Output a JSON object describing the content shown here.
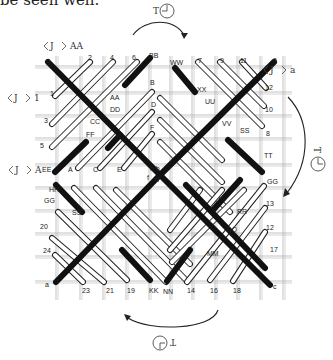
{
  "caption": "be seen well.",
  "rotation_labels": {
    "top": "T",
    "right": "T",
    "bottom": "T"
  },
  "side_labels": [
    {
      "id": "AA",
      "text": "AA",
      "x": 70,
      "y": 46
    },
    {
      "id": "1",
      "text": "1",
      "x": 34,
      "y": 98
    },
    {
      "id": "A",
      "text": "A",
      "x": 35,
      "y": 170
    },
    {
      "id": "a",
      "text": "a",
      "x": 290,
      "y": 70
    }
  ],
  "colors": {
    "grid": "#aaaaaa",
    "black_strand": "#111111",
    "white_strand_fill": "#ffffff",
    "white_strand_stroke": "#222222",
    "text": "#222222"
  },
  "grid": {
    "x": [
      56,
      80,
      103,
      126,
      149,
      170,
      192,
      215,
      237,
      260,
      283
    ],
    "y": [
      66,
      92,
      115,
      138,
      164,
      187,
      210,
      233,
      256,
      281
    ]
  },
  "strand_labels": [
    {
      "t": "g",
      "x": 46,
      "y": 63
    },
    {
      "t": "2",
      "x": 88,
      "y": 60
    },
    {
      "t": "4",
      "x": 110,
      "y": 60
    },
    {
      "t": "6",
      "x": 132,
      "y": 60
    },
    {
      "t": "BB",
      "x": 149,
      "y": 58
    },
    {
      "t": "WW",
      "x": 170,
      "y": 65
    },
    {
      "t": "7",
      "x": 198,
      "y": 63
    },
    {
      "t": "9",
      "x": 220,
      "y": 63
    },
    {
      "t": "11",
      "x": 240,
      "y": 63
    },
    {
      "t": "a",
      "x": 273,
      "y": 62
    },
    {
      "t": "1",
      "x": 50,
      "y": 96
    },
    {
      "t": "AA",
      "x": 110,
      "y": 100
    },
    {
      "t": "XX",
      "x": 197,
      "y": 92
    },
    {
      "t": "12",
      "x": 265,
      "y": 90
    },
    {
      "t": "3",
      "x": 44,
      "y": 123
    },
    {
      "t": "CC",
      "x": 90,
      "y": 124
    },
    {
      "t": "DD",
      "x": 110,
      "y": 112
    },
    {
      "t": "B",
      "x": 150,
      "y": 85
    },
    {
      "t": "UU",
      "x": 205,
      "y": 104
    },
    {
      "t": "VV",
      "x": 222,
      "y": 126
    },
    {
      "t": "10",
      "x": 265,
      "y": 112
    },
    {
      "t": "5",
      "x": 40,
      "y": 148
    },
    {
      "t": "FF",
      "x": 86,
      "y": 137
    },
    {
      "t": "D",
      "x": 151,
      "y": 107
    },
    {
      "t": "SS",
      "x": 240,
      "y": 133
    },
    {
      "t": "8",
      "x": 266,
      "y": 136
    },
    {
      "t": "F",
      "x": 150,
      "y": 130
    },
    {
      "t": "EE",
      "x": 42,
      "y": 172
    },
    {
      "t": "A",
      "x": 68,
      "y": 172
    },
    {
      "t": "C",
      "x": 93,
      "y": 172
    },
    {
      "t": "E",
      "x": 117,
      "y": 172
    },
    {
      "t": "h b",
      "x": 150,
      "y": 171
    },
    {
      "t": "TT",
      "x": 264,
      "y": 158
    },
    {
      "t": "f",
      "x": 147,
      "y": 180
    },
    {
      "t": "d",
      "x": 155,
      "y": 182
    },
    {
      "t": "GG",
      "x": 267,
      "y": 184
    },
    {
      "t": "HH",
      "x": 49,
      "y": 192
    },
    {
      "t": "GG",
      "x": 44,
      "y": 203
    },
    {
      "t": "13",
      "x": 266,
      "y": 206
    },
    {
      "t": "SS",
      "x": 72,
      "y": 215
    },
    {
      "t": "RR",
      "x": 237,
      "y": 214
    },
    {
      "t": "20",
      "x": 40,
      "y": 229
    },
    {
      "t": "QQ",
      "x": 226,
      "y": 232
    },
    {
      "t": "12",
      "x": 266,
      "y": 230
    },
    {
      "t": "24",
      "x": 43,
      "y": 253
    },
    {
      "t": "MM",
      "x": 207,
      "y": 256
    },
    {
      "t": "17",
      "x": 270,
      "y": 252
    },
    {
      "t": "a",
      "x": 45,
      "y": 287
    },
    {
      "t": "23",
      "x": 82,
      "y": 293
    },
    {
      "t": "21",
      "x": 106,
      "y": 293
    },
    {
      "t": "19",
      "x": 127,
      "y": 293
    },
    {
      "t": "KK",
      "x": 149,
      "y": 293
    },
    {
      "t": "NN",
      "x": 163,
      "y": 294
    },
    {
      "t": "14",
      "x": 187,
      "y": 293
    },
    {
      "t": "16",
      "x": 210,
      "y": 293
    },
    {
      "t": "18",
      "x": 233,
      "y": 293
    },
    {
      "t": "c",
      "x": 273,
      "y": 289
    }
  ],
  "black_strands": [
    [
      48,
      62,
      160,
      175
    ],
    [
      150,
      58,
      125,
      85
    ],
    [
      175,
      68,
      195,
      92
    ],
    [
      274,
      62,
      160,
      175
    ],
    [
      120,
      135,
      108,
      148
    ],
    [
      86,
      142,
      55,
      172
    ],
    [
      56,
      185,
      82,
      212
    ],
    [
      228,
      140,
      262,
      172
    ],
    [
      186,
      185,
      265,
      268
    ],
    [
      240,
      180,
      213,
      210
    ],
    [
      160,
      175,
      56,
      282
    ],
    [
      160,
      175,
      270,
      285
    ],
    [
      190,
      250,
      167,
      281
    ],
    [
      122,
      250,
      150,
      280
    ]
  ],
  "white_strands": [
    [
      90,
      62,
      55,
      96
    ],
    [
      113,
      62,
      52,
      124
    ],
    [
      137,
      62,
      52,
      147
    ],
    [
      198,
      62,
      262,
      126
    ],
    [
      220,
      62,
      264,
      106
    ],
    [
      242,
      62,
      266,
      88
    ],
    [
      152,
      92,
      78,
      168
    ],
    [
      152,
      112,
      100,
      168
    ],
    [
      152,
      134,
      124,
      168
    ],
    [
      160,
      98,
      222,
      160
    ],
    [
      160,
      120,
      222,
      182
    ],
    [
      160,
      142,
      230,
      212
    ],
    [
      74,
      188,
      166,
      282
    ],
    [
      96,
      188,
      186,
      280
    ],
    [
      116,
      190,
      190,
      264
    ],
    [
      58,
      212,
      127,
      280
    ],
    [
      52,
      238,
      104,
      282
    ],
    [
      55,
      255,
      83,
      282
    ],
    [
      264,
      186,
      187,
      282
    ],
    [
      265,
      208,
      210,
      280
    ],
    [
      265,
      232,
      233,
      281
    ],
    [
      200,
      190,
      170,
      230
    ],
    [
      222,
      190,
      170,
      250
    ],
    [
      244,
      190,
      172,
      262
    ]
  ]
}
